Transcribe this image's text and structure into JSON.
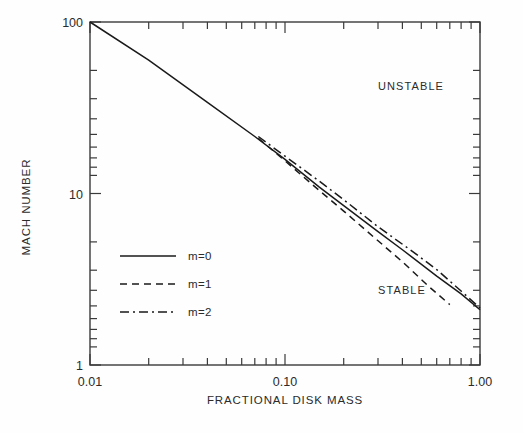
{
  "chart_data": {
    "type": "line",
    "title": "",
    "xlabel": "FRACTIONAL DISK MASS",
    "ylabel": "MACH NUMBER",
    "xscale": "log",
    "yscale": "log",
    "xlim": [
      0.01,
      1.0
    ],
    "ylim": [
      1,
      100
    ],
    "grid": false,
    "xticks": [
      0.01,
      0.1,
      1.0
    ],
    "xtick_labels": [
      "0.01",
      "0.10",
      "1.00"
    ],
    "yticks": [
      1,
      10,
      100
    ],
    "ytick_labels": [
      "1",
      "10",
      "100"
    ],
    "legend_position": "center-left",
    "annotations": [
      {
        "text": "UNSTABLE",
        "x": 0.3,
        "y": 40
      },
      {
        "text": "STABLE",
        "x": 0.3,
        "y": 2.6
      }
    ],
    "series": [
      {
        "name": "m=0",
        "label": "m=0",
        "style": "solid",
        "color": "#1a1a1a",
        "x": [
          0.01,
          0.02,
          0.04,
          0.07,
          0.1,
          0.15,
          0.2,
          0.3,
          0.4,
          0.6,
          0.8,
          1.0
        ],
        "y": [
          100.0,
          60.0,
          34.0,
          21.5,
          15.8,
          10.9,
          8.5,
          6.0,
          4.7,
          3.3,
          2.6,
          2.1
        ]
      },
      {
        "name": "m=1",
        "label": "m=1",
        "style": "dashed",
        "color": "#1a1a1a",
        "x": [
          0.073,
          0.1,
          0.15,
          0.2,
          0.3,
          0.4,
          0.55,
          0.7
        ],
        "y": [
          21.0,
          15.5,
          10.4,
          7.9,
          5.3,
          4.0,
          2.85,
          2.25
        ]
      },
      {
        "name": "m=2",
        "label": "m=2",
        "style": "dashdot",
        "color": "#1a1a1a",
        "x": [
          0.073,
          0.1,
          0.15,
          0.2,
          0.3,
          0.45,
          0.6,
          0.8,
          1.0
        ],
        "y": [
          21.5,
          16.5,
          11.8,
          9.2,
          6.4,
          4.6,
          3.6,
          2.7,
          2.15
        ]
      }
    ]
  },
  "axes": {
    "x_axis_title": "FRACTIONAL DISK MASS",
    "y_axis_title": "MACH NUMBER",
    "x_tick_labels": [
      "0.01",
      "0.10",
      "1.00"
    ],
    "y_tick_labels": [
      "100",
      "10",
      "1"
    ]
  },
  "regions": {
    "unstable_label": "UNSTABLE",
    "stable_label": "STABLE"
  },
  "legend": {
    "items": [
      {
        "label": "m=0",
        "style": "solid"
      },
      {
        "label": "m=1",
        "style": "dashed"
      },
      {
        "label": "m=2",
        "style": "dashdot"
      }
    ]
  },
  "colors": {
    "line": "#1a1a1a",
    "axis": "#3a3a3a",
    "background": "#fefefe"
  }
}
